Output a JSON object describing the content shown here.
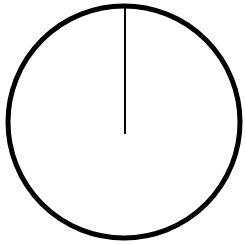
{
  "canvas": {
    "width": 245,
    "height": 244,
    "background_color": "#ffffff",
    "description": "Line drawing of a circle with a single vertical radius line from the top of the circle to its center",
    "figure_name": "circle-with-vertical-radius"
  },
  "figure": {
    "type": "line-art",
    "stroke_color": "#000000",
    "fill_color": "none",
    "elements": [
      {
        "name": "circle-outline",
        "shape": "circle",
        "center_x": 124,
        "center_y": 122,
        "radius": 116,
        "stroke_width": 5,
        "stroke_color": "#000000",
        "fill": "none"
      },
      {
        "name": "radius-line",
        "shape": "line",
        "x1": 125,
        "y1": 6,
        "x2": 125,
        "y2": 134,
        "stroke_width": 2,
        "stroke_color": "#000000",
        "orientation": "vertical",
        "from": "top-of-circle",
        "to": "center-of-circle"
      }
    ]
  }
}
